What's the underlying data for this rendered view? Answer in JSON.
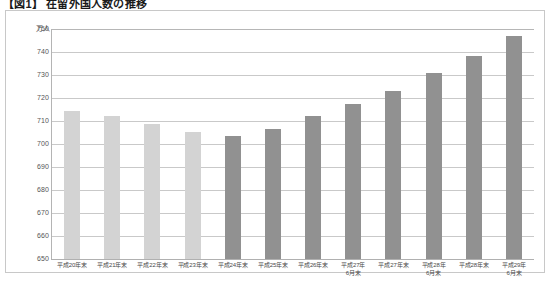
{
  "title": "【図1】 在留外国人数の推移",
  "axis": {
    "unit_label": "万人",
    "y_ticks": [
      "750",
      "740",
      "730",
      "720",
      "710",
      "700",
      "690",
      "680",
      "670",
      "660",
      "650"
    ]
  },
  "colors": {
    "bar_light": "#d3d3d3",
    "bar_dark": "#919191",
    "gridline": "#c9c9c9",
    "frame": "#c8c8c8",
    "text": "#4a4a4a"
  },
  "chart_data": {
    "type": "bar",
    "title": "【図1】 在留外国人数の推移",
    "xlabel": "",
    "ylabel": "万人",
    "ylim": [
      650,
      750
    ],
    "ytick_step": 10,
    "grid": true,
    "legend": "none",
    "categories": [
      "平成20年末",
      "平成21年末",
      "平成22年末",
      "平成23年末",
      "平成24年末",
      "平成25年末",
      "平成26年末",
      "平成27年\n6月末",
      "平成27年末",
      "平成28年\n6月末",
      "平成28年末",
      "平成29年\n6月末"
    ],
    "values": [
      714.4,
      712.2,
      708.5,
      705.3,
      703.3,
      706.7,
      712.1,
      717.2,
      723.2,
      730.7,
      738.2,
      747.1
    ],
    "series": [
      {
        "name": "在留外国人数",
        "values": [
          714.4,
          712.2,
          708.5,
          705.3,
          703.3,
          706.7,
          712.1,
          717.2,
          723.2,
          730.7,
          738.2,
          747.1
        ]
      }
    ]
  },
  "bars": [
    {
      "label_l1": "平成20年末",
      "label_l2": "",
      "value": 714.4,
      "shade": "light"
    },
    {
      "label_l1": "平成21年末",
      "label_l2": "",
      "value": 712.2,
      "shade": "light"
    },
    {
      "label_l1": "平成22年末",
      "label_l2": "",
      "value": 708.5,
      "shade": "light"
    },
    {
      "label_l1": "平成23年末",
      "label_l2": "",
      "value": 705.3,
      "shade": "light"
    },
    {
      "label_l1": "平成24年末",
      "label_l2": "",
      "value": 703.3,
      "shade": "dark"
    },
    {
      "label_l1": "平成25年末",
      "label_l2": "",
      "value": 706.7,
      "shade": "dark"
    },
    {
      "label_l1": "平成26年末",
      "label_l2": "",
      "value": 712.1,
      "shade": "dark"
    },
    {
      "label_l1": "平成27年",
      "label_l2": "6月末",
      "value": 717.2,
      "shade": "dark"
    },
    {
      "label_l1": "平成27年末",
      "label_l2": "",
      "value": 723.2,
      "shade": "dark"
    },
    {
      "label_l1": "平成28年",
      "label_l2": "6月末",
      "value": 730.7,
      "shade": "dark"
    },
    {
      "label_l1": "平成28年末",
      "label_l2": "",
      "value": 738.2,
      "shade": "dark"
    },
    {
      "label_l1": "平成29年",
      "label_l2": "6月末",
      "value": 747.1,
      "shade": "dark"
    }
  ]
}
